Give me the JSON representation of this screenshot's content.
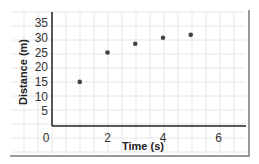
{
  "chart_data": {
    "type": "scatter",
    "title": "",
    "xlabel": "Time (s)",
    "ylabel": "Distance (m)",
    "xlim": [
      0,
      6
    ],
    "ylim": [
      0,
      35
    ],
    "x_ticks": [
      "0",
      "2",
      "4",
      "6"
    ],
    "y_ticks": [
      "5",
      "10",
      "15",
      "20",
      "25",
      "30",
      "35"
    ],
    "grid": true,
    "legend": null,
    "series": [
      {
        "name": "Distance",
        "x": [
          1,
          2,
          3,
          4,
          5
        ],
        "values": [
          15,
          25,
          28,
          30,
          31
        ]
      }
    ],
    "colors": {
      "points": "#444444",
      "axes": "#222222",
      "grid": "#e6e6e6",
      "frame": "#9a9a9a"
    }
  }
}
